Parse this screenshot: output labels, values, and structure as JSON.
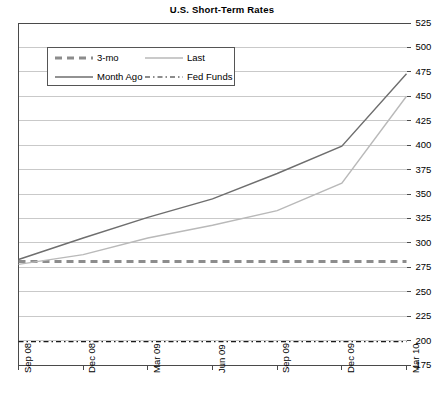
{
  "chart_data": {
    "type": "line",
    "title": "U.S. Short-Term Rates",
    "xlabel": "",
    "ylabel": "",
    "ylim": [
      175,
      525
    ],
    "ytick_step": 25,
    "yticks": [
      525,
      500,
      475,
      450,
      425,
      400,
      375,
      350,
      325,
      300,
      275,
      250,
      225,
      200,
      175
    ],
    "categories": [
      "Sep 08",
      "Dec 08",
      "Mar 09",
      "Jun 09",
      "Sep 09",
      "Dec 09",
      "Mar 10"
    ],
    "x": [
      0,
      1,
      2,
      3,
      4,
      5,
      6
    ],
    "grid": true,
    "legend_position": "upper-left-inside",
    "series": [
      {
        "name": "3-mo",
        "style": "dashed",
        "color": "#8c8c8c",
        "width": 3,
        "values": [
          281,
          281,
          281,
          281,
          281,
          281,
          281
        ]
      },
      {
        "name": "Last",
        "style": "solid",
        "color": "#b9b9b9",
        "width": 1.4,
        "values": [
          278,
          288,
          305,
          318,
          333,
          361,
          450
        ]
      },
      {
        "name": "Month Ago",
        "style": "solid",
        "color": "#6e6e6e",
        "width": 1.4,
        "values": [
          283,
          305,
          326,
          345,
          371,
          399,
          473
        ]
      },
      {
        "name": "Fed Funds",
        "style": "dashdot",
        "color": "#1a1a1a",
        "width": 1.2,
        "values": [
          199,
          199,
          199,
          199,
          199,
          199,
          199
        ]
      }
    ]
  },
  "legend": {
    "rows": [
      [
        {
          "label": "3-mo",
          "series": "3-mo"
        },
        {
          "label": "Last",
          "series": "Last"
        }
      ],
      [
        {
          "label": "Month Ago",
          "series": "Month Ago"
        },
        {
          "label": "Fed Funds",
          "series": "Fed Funds"
        }
      ]
    ]
  },
  "colors": {
    "axis": "#4a4a4a",
    "grid": "#c9c9c9",
    "text": "#000000",
    "background": "#ffffff"
  }
}
